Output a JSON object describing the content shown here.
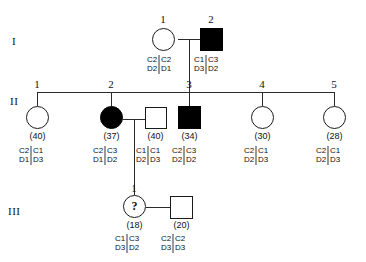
{
  "figure": {
    "type": "pedigree-chart",
    "symbol_legend": {
      "circle": "female",
      "square": "male",
      "filled": "affected",
      "open": "unaffected",
      "question_mark": "unknown / at-risk status"
    },
    "colors": {
      "line": "#2b2b2b",
      "affected_fill": "#000000",
      "unaffected_fill": "#ffffff",
      "haplotype_bar": "#9a9a9a",
      "text": "#111111"
    }
  },
  "generations": [
    {
      "label": "I"
    },
    {
      "label": "II"
    },
    {
      "label": "III"
    }
  ],
  "individuals": [
    {
      "key": "I-1",
      "generation": "I",
      "id": "1",
      "sex": "female",
      "shape": "circle",
      "affected": false,
      "age": "",
      "haplotypes": [
        {
          "top": "C2",
          "bottom": "D2"
        },
        {
          "top": "C2",
          "bottom": "D1"
        }
      ]
    },
    {
      "key": "I-2",
      "generation": "I",
      "id": "2",
      "sex": "male",
      "shape": "square",
      "affected": true,
      "age": "",
      "haplotypes": [
        {
          "top": "C1",
          "bottom": "D3"
        },
        {
          "top": "C3",
          "bottom": "D2"
        }
      ]
    },
    {
      "key": "II-1",
      "generation": "II",
      "id": "1",
      "sex": "female",
      "shape": "circle",
      "affected": false,
      "age": "(40)",
      "haplotypes": [
        {
          "top": "C2",
          "bottom": "D1"
        },
        {
          "top": "C1",
          "bottom": "D3"
        }
      ]
    },
    {
      "key": "II-2",
      "generation": "II",
      "id": "2",
      "sex": "female",
      "shape": "circle",
      "affected": true,
      "age": "(37)",
      "haplotypes": [
        {
          "top": "C2",
          "bottom": "D1"
        },
        {
          "top": "C3",
          "bottom": "D2"
        }
      ]
    },
    {
      "key": "II-2-spouse",
      "generation": "II",
      "id": "",
      "sex": "male",
      "shape": "square",
      "affected": false,
      "age": "(40)",
      "haplotypes": [
        {
          "top": "C1",
          "bottom": "D2"
        },
        {
          "top": "C1",
          "bottom": "D3"
        }
      ]
    },
    {
      "key": "II-3",
      "generation": "II",
      "id": "3",
      "sex": "male",
      "shape": "square",
      "affected": true,
      "age": "(34)",
      "haplotypes": [
        {
          "top": "C2",
          "bottom": "D2"
        },
        {
          "top": "C3",
          "bottom": "D2"
        }
      ]
    },
    {
      "key": "II-4",
      "generation": "II",
      "id": "4",
      "sex": "female",
      "shape": "circle",
      "affected": false,
      "age": "(30)",
      "haplotypes": [
        {
          "top": "C2",
          "bottom": "D2"
        },
        {
          "top": "C1",
          "bottom": "D3"
        }
      ]
    },
    {
      "key": "II-5",
      "generation": "II",
      "id": "5",
      "sex": "female",
      "shape": "circle",
      "affected": false,
      "age": "(28)",
      "haplotypes": [
        {
          "top": "C2",
          "bottom": "D2"
        },
        {
          "top": "C1",
          "bottom": "D3"
        }
      ]
    },
    {
      "key": "III-1",
      "generation": "III",
      "id": "1",
      "sex": "female",
      "shape": "circle",
      "affected": false,
      "status_marker": "?",
      "age": "(18)",
      "haplotypes": [
        {
          "top": "C1",
          "bottom": "D3"
        },
        {
          "top": "C3",
          "bottom": "D2"
        }
      ]
    },
    {
      "key": "III-1-spouse",
      "generation": "III",
      "id": "",
      "sex": "male",
      "shape": "square",
      "affected": false,
      "age": "(20)",
      "haplotypes": [
        {
          "top": "C2",
          "bottom": "D3"
        },
        {
          "top": "C2",
          "bottom": "D3"
        }
      ]
    }
  ]
}
